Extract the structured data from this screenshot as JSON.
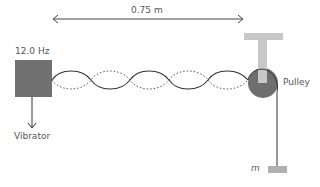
{
  "labels": {
    "length": "0.75 m",
    "frequency": "12.0 Hz",
    "vibrator": "Vibrator",
    "pulley": "Pulley",
    "mass": "m"
  },
  "diagram": {
    "loops": 5,
    "colors": {
      "vibrator": "#707070",
      "pulley": "#6e6e6e",
      "support": "#c8c8c8",
      "string": "#333333",
      "mass": "#b0b0b0"
    }
  }
}
